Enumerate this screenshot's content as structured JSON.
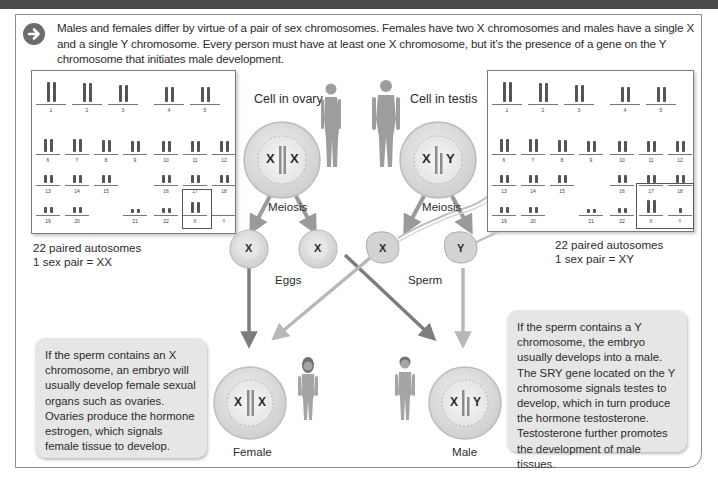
{
  "intro": {
    "icon": "arrow-right-circle-icon",
    "text": "Males and females differ by virtue of a pair of sex chromosomes. Females have two X chromosomes and males have a single X and a single Y chromosome. Every person must have at least one X chromosome, but it’s the presence of a gene on the Y chromosome that initiates male development."
  },
  "colors": {
    "topbar": "#4a4a4a",
    "arrow_dark": "#7d7d7d",
    "arrow_light": "#b8b8b8",
    "cell_fill": "#dcdcdc",
    "infobox": "#e6e6e6"
  },
  "karyotype_female": {
    "numbers": [
      "1",
      "2",
      "3",
      "4",
      "5",
      "6",
      "7",
      "8",
      "9",
      "10",
      "11",
      "12",
      "13",
      "14",
      "15",
      "16",
      "17",
      "18",
      "19",
      "20",
      "21",
      "22",
      "X",
      "Y"
    ],
    "caption_line1": "22 paired autosomes",
    "caption_line2": "1 sex pair = XX"
  },
  "karyotype_male": {
    "numbers": [
      "1",
      "2",
      "3",
      "4",
      "5",
      "6",
      "7",
      "8",
      "9",
      "10",
      "11",
      "12",
      "13",
      "14",
      "15",
      "16",
      "17",
      "18",
      "19",
      "20",
      "21",
      "22",
      "X",
      "Y"
    ],
    "caption_line1": "22 paired autosomes",
    "caption_line2": "1 sex pair = XY"
  },
  "cells": {
    "ovary_label": "Cell in ovary",
    "ovary_chromosomes": [
      "X",
      "X"
    ],
    "testis_label": "Cell in testis",
    "testis_chromosomes": [
      "X",
      "Y"
    ],
    "meiosis_left": "Meiosis",
    "meiosis_right": "Meiosis"
  },
  "gametes": {
    "egg1": "X",
    "egg2": "X",
    "eggs_label": "Eggs",
    "sperm1": "X",
    "sperm2": "Y",
    "sperm_label": "Sperm"
  },
  "offspring": {
    "female_label": "Female",
    "female_chromosomes": [
      "X",
      "X"
    ],
    "male_label": "Male",
    "male_chromosomes": [
      "X",
      "Y"
    ]
  },
  "info_female": "If the sperm contains an X chromosome, an embryo will usually develop female sexual organs such as ovaries. Ovaries produce the hormone estrogen, which signals female tissue to develop.",
  "info_male": "If the sperm contains a Y chromosome, the embryo usually develops into a male. The SRY gene located on the Y chromosome signals testes to develop, which in turn produce the hormone testosterone. Testosterone further promotes the development of male tissues."
}
